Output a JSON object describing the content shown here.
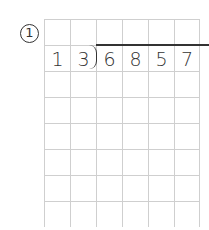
{
  "problem": {
    "number_label": "1",
    "divisor": [
      "1",
      "3"
    ],
    "dividend": [
      "6",
      "8",
      "5",
      "7"
    ]
  },
  "grid": {
    "columns": 6,
    "rows": 8,
    "cell_size": 26,
    "line_color": "#cfcfcf",
    "text_color": "#333333"
  }
}
